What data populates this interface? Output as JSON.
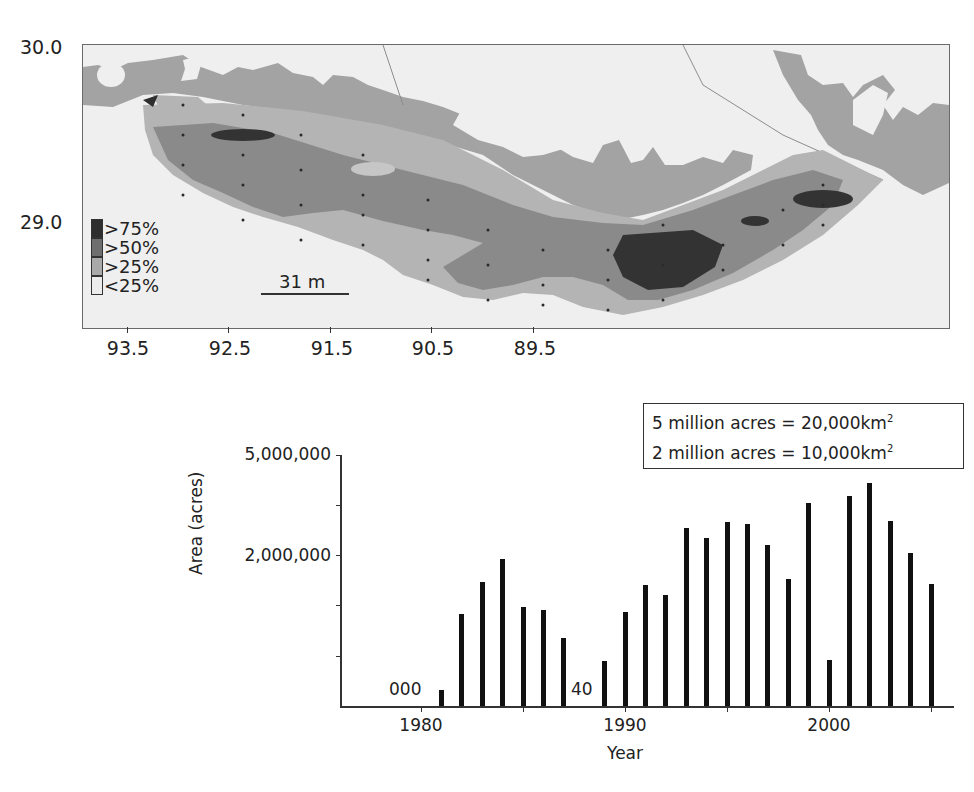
{
  "map": {
    "y_tick_labels": [
      {
        "label": "30.0",
        "top": 38
      },
      {
        "label": "29.0",
        "top": 212
      }
    ],
    "x_tick_labels": [
      {
        "label": "93.5",
        "x": 128
      },
      {
        "label": "92.5",
        "x": 230
      },
      {
        "label": "91.5",
        "x": 332
      },
      {
        "label": "90.5",
        "x": 433
      },
      {
        "label": "89.5",
        "x": 535
      }
    ],
    "legend": [
      {
        "label": ">75%",
        "color": "#2e2e2e"
      },
      {
        "label": ">50%",
        "color": "#6e6e6e"
      },
      {
        "label": ">25%",
        "color": "#a9a9a9"
      },
      {
        "label": "<25%",
        "color": "#ececec"
      }
    ],
    "scale_bar_label": "31 m",
    "colors": {
      "land": "#a3a3a3",
      "water": "#efefef",
      "lt25": "#e6e6e6",
      "gt25": "#b4b4b4",
      "gt50": "#8a8a8a",
      "gt75": "#333333"
    }
  },
  "note_box": {
    "line1_prefix": "5 million acres = 20,000km",
    "line2_prefix": "2 million acres = 10,000km",
    "superscript": "2"
  },
  "chart_data": {
    "type": "bar",
    "title": "",
    "xlabel": "Year",
    "ylabel": "Area (acres)",
    "y_tick_labels": [
      "5,000,000",
      "2,000,000"
    ],
    "x_tick_labels": [
      "1980",
      "1990",
      "2000"
    ],
    "annotations": [
      {
        "text": "000",
        "near_year": 1979
      },
      {
        "text": "40",
        "near_year": 1988
      }
    ],
    "legend": [],
    "grid": false,
    "categories": [
      1981,
      1982,
      1983,
      1984,
      1985,
      1986,
      1987,
      1988,
      1989,
      1990,
      1991,
      1992,
      1993,
      1994,
      1995,
      1996,
      1997,
      1998,
      1999,
      2000,
      2001,
      2002,
      2003,
      2004,
      2005
    ],
    "values": [
      212000,
      1217000,
      1642000,
      1950000,
      1310000,
      1270000,
      900000,
      40,
      595000,
      1245000,
      1600000,
      1470000,
      2350000,
      2220000,
      2435000,
      2410000,
      2130000,
      1680000,
      2690000,
      610000,
      2780000,
      2950000,
      2450000,
      2030000,
      1620000
    ],
    "bar_tops_px": [
      690,
      614,
      582,
      559,
      607,
      610,
      638,
      706,
      661,
      612,
      585,
      595,
      528,
      538,
      522,
      524,
      545,
      579,
      503,
      660,
      496,
      483,
      521,
      553,
      584
    ],
    "ylim": [
      0,
      5000000
    ]
  },
  "chart_labels": {
    "ylabel": "Area (acres)",
    "xlabel": "Year",
    "ytick_top": "5,000,000",
    "ytick_mid": "2,000,000",
    "xtick_1980": "1980",
    "xtick_1990": "1990",
    "xtick_2000": "2000",
    "annot_000": "000",
    "annot_40": "40"
  }
}
